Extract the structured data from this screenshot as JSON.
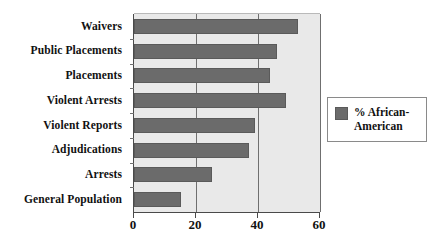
{
  "chart_data": {
    "type": "bar",
    "orientation": "horizontal",
    "title": "",
    "xlabel": "",
    "ylabel": "",
    "xlim": [
      0,
      60
    ],
    "xticks": [
      0,
      20,
      40,
      60
    ],
    "grid": true,
    "legend_position": "right",
    "categories": [
      "General Population",
      "Arrests",
      "Adjudications",
      "Violent Reports",
      "Violent Arrests",
      "Placements",
      "Public Placements",
      "Waivers"
    ],
    "series": [
      {
        "name": "% African-American",
        "values": [
          15,
          25,
          37,
          39,
          49,
          44,
          46,
          53
        ]
      }
    ]
  },
  "legend": {
    "entries": [
      {
        "label": "% African-American",
        "color": "#6b6b6b"
      }
    ]
  },
  "colors": {
    "bar": "#6b6b6b",
    "plot_background": "#e9e9e9",
    "axis": "#4a4a4a",
    "gridline": "#6f6f6f",
    "text": "#111111"
  }
}
